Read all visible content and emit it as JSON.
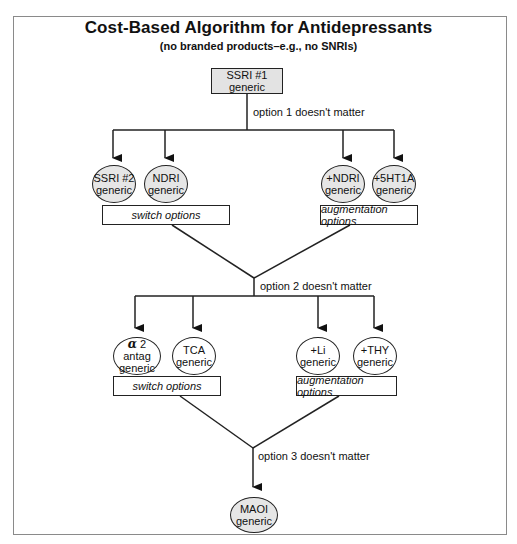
{
  "title": "Cost-Based Algorithm for Antidepressants",
  "subtitle": "(no branded products–e.g., no SNRIs)",
  "start": {
    "line1": "SSRI #1",
    "line2": "generic"
  },
  "step1": {
    "connector_label": "option 1 doesn't matter",
    "switch_nodes": [
      {
        "line1": "SSRI #2",
        "line2": "generic"
      },
      {
        "line1": "NDRI",
        "line2": "generic"
      }
    ],
    "augment_nodes": [
      {
        "line1": "+NDRI",
        "line2": "generic"
      },
      {
        "line1": "+5HT1A",
        "line2": "generic"
      }
    ],
    "switch_label": "switch options",
    "augment_label": "augmentation options"
  },
  "step2": {
    "connector_label": "option 2 doesn't matter",
    "switch_nodes": [
      {
        "symbol": "α",
        "line1": "2 antag",
        "line2": "generic"
      },
      {
        "line1": "TCA",
        "line2": "generic"
      }
    ],
    "augment_nodes": [
      {
        "line1": "+Li",
        "line2": "generic"
      },
      {
        "line1": "+THY",
        "line2": "generic"
      }
    ],
    "switch_label": "switch options",
    "augment_label": "augmentation options"
  },
  "step3": {
    "connector_label": "option 3 doesn't matter",
    "final": {
      "line1": "MAOI",
      "line2": "generic"
    }
  },
  "colors": {
    "shaded_fill": "#e6e6e6",
    "start_fill": "#e3e3e3",
    "stroke": "#222222",
    "frame": "#8a8a8a"
  }
}
